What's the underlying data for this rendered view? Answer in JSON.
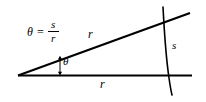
{
  "figure": {
    "background_color": "#ffffff",
    "stroke_color": "#000000",
    "formula": {
      "lhs": "θ",
      "operator": "=",
      "numerator": "s",
      "denominator": "r"
    },
    "labels": {
      "radius_upper": "r",
      "radius_lower": "r",
      "arc_length": "s",
      "angle": "θ"
    },
    "geometry": {
      "vertex": [
        18,
        76
      ],
      "baseline_end": [
        192,
        76
      ],
      "ray_end": [
        190,
        13
      ],
      "arc_start": [
        163,
        7
      ],
      "arc_mid": [
        166,
        48
      ],
      "arc_end": [
        172,
        95
      ],
      "angle_marker_x": 60,
      "angle_marker_top_y": 56,
      "angle_marker_bottom_y": 75
    }
  }
}
